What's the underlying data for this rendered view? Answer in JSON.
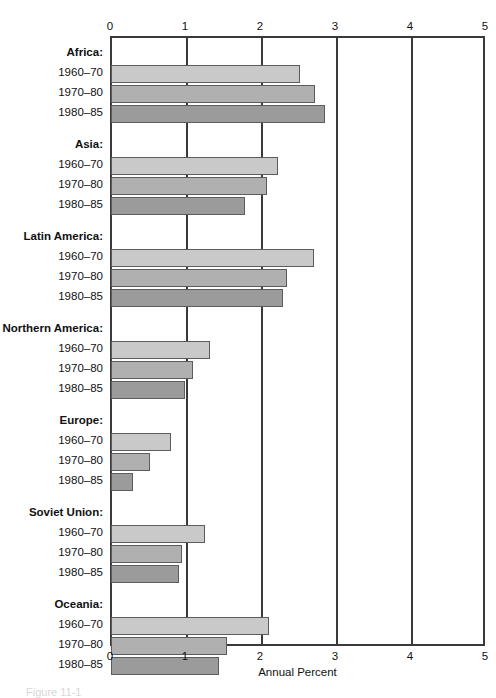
{
  "figure": {
    "caption": "Figure 11-1",
    "axis_title": "Annual Percent"
  },
  "chart_data": {
    "type": "bar",
    "orientation": "horizontal",
    "title": "",
    "xlabel": "Annual Percent",
    "ylabel": "",
    "xlim": [
      0,
      5
    ],
    "xticks": [
      0,
      1,
      2,
      3,
      4,
      5
    ],
    "xticklabels": [
      "0",
      "1",
      "2",
      "3",
      "4",
      "5"
    ],
    "grid": "vertical",
    "legend_position": "none",
    "series_names": [
      "1960–70",
      "1970–80",
      "1980–85"
    ],
    "series_colors": [
      "#c9c9c9",
      "#b0b0b0",
      "#9b9b9b"
    ],
    "categories": [
      "Africa:",
      "Asia:",
      "Latin America:",
      "Northern America:",
      "Europe:",
      "Soviet Union:",
      "Oceania:"
    ],
    "series": [
      {
        "name": "1960–70",
        "values": [
          2.5,
          2.21,
          2.69,
          1.31,
          0.78,
          1.24,
          2.09
        ]
      },
      {
        "name": "1970–80",
        "values": [
          2.7,
          2.07,
          2.33,
          1.08,
          0.51,
          0.93,
          1.53
        ]
      },
      {
        "name": "1980–85",
        "values": [
          2.84,
          1.77,
          2.28,
          0.97,
          0.28,
          0.89,
          1.43
        ]
      }
    ],
    "groups": [
      {
        "label": "Africa:",
        "bars": [
          {
            "period": "1960–70",
            "value": 2.5
          },
          {
            "period": "1970–80",
            "value": 2.7
          },
          {
            "period": "1980–85",
            "value": 2.84
          }
        ]
      },
      {
        "label": "Asia:",
        "bars": [
          {
            "period": "1960–70",
            "value": 2.21
          },
          {
            "period": "1970–80",
            "value": 2.07
          },
          {
            "period": "1980–85",
            "value": 1.77
          }
        ]
      },
      {
        "label": "Latin America:",
        "bars": [
          {
            "period": "1960–70",
            "value": 2.69
          },
          {
            "period": "1970–80",
            "value": 2.33
          },
          {
            "period": "1980–85",
            "value": 2.28
          }
        ]
      },
      {
        "label": "Northern America:",
        "bars": [
          {
            "period": "1960–70",
            "value": 1.31
          },
          {
            "period": "1970–80",
            "value": 1.08
          },
          {
            "period": "1980–85",
            "value": 0.97
          }
        ]
      },
      {
        "label": "Europe:",
        "bars": [
          {
            "period": "1960–70",
            "value": 0.78
          },
          {
            "period": "1970–80",
            "value": 0.51
          },
          {
            "period": "1980–85",
            "value": 0.28
          }
        ]
      },
      {
        "label": "Soviet Union:",
        "bars": [
          {
            "period": "1960–70",
            "value": 1.24
          },
          {
            "period": "1970–80",
            "value": 0.93
          },
          {
            "period": "1980–85",
            "value": 0.89
          }
        ]
      },
      {
        "label": "Oceania:",
        "bars": [
          {
            "period": "1960–70",
            "value": 2.09
          },
          {
            "period": "1970–80",
            "value": 1.53
          },
          {
            "period": "1980–85",
            "value": 1.43
          }
        ]
      }
    ]
  }
}
